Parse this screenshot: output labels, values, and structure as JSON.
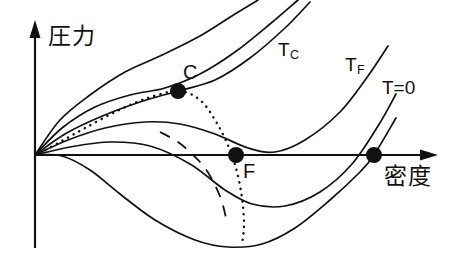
{
  "figure": {
    "name": "pressure-density-isotherm-diagram",
    "axes": {
      "y_axis_label": "圧力",
      "x_axis_label": "密度",
      "origin_label": ""
    },
    "curve_labels": [
      {
        "id": "tc",
        "text": "T",
        "subscript": "C",
        "x": 278,
        "y": 40
      },
      {
        "id": "tf",
        "text": "T",
        "subscript": "F",
        "x": 345,
        "y": 55
      },
      {
        "id": "tzero",
        "text": "T=0",
        "subscript": "",
        "x": 382,
        "y": 78
      }
    ],
    "points": [
      {
        "id": "critical-point",
        "label": "C",
        "x": 178,
        "y": 91,
        "label_x": 183,
        "label_y": 62
      },
      {
        "id": "freezing-point",
        "label": "F",
        "x": 236,
        "y": 155,
        "label_x": 243,
        "label_y": 161
      },
      {
        "id": "zero-temp-point",
        "label": "",
        "x": 374,
        "y": 155,
        "label_x": 0,
        "label_y": 0
      }
    ]
  },
  "chart_data": {
    "type": "line",
    "title": "",
    "xlabel": "密度",
    "ylabel": "圧力",
    "grid": false,
    "legend": "inline-curve-labels",
    "series": [
      {
        "name": "isotherm-1-highest-T",
        "label": "",
        "style": "solid",
        "points": [
          [
            35,
            155
          ],
          [
            60,
            120
          ],
          [
            90,
            95
          ],
          [
            125,
            72
          ],
          [
            160,
            56
          ],
          [
            200,
            36
          ],
          [
            235,
            14
          ],
          [
            258,
            0
          ]
        ]
      },
      {
        "name": "isotherm-2",
        "label": "",
        "style": "solid",
        "points": [
          [
            35,
            155
          ],
          [
            62,
            128
          ],
          [
            95,
            107
          ],
          [
            130,
            95
          ],
          [
            165,
            88
          ],
          [
            200,
            74
          ],
          [
            235,
            52
          ],
          [
            270,
            24
          ],
          [
            298,
            0
          ]
        ]
      },
      {
        "name": "isotherm-3-critical",
        "label": "T_C",
        "style": "solid",
        "points": [
          [
            35,
            155
          ],
          [
            65,
            134
          ],
          [
            100,
            117
          ],
          [
            140,
            102
          ],
          [
            178,
            91
          ],
          [
            215,
            80
          ],
          [
            250,
            58
          ],
          [
            285,
            28
          ],
          [
            310,
            2
          ]
        ]
      },
      {
        "name": "isotherm-4",
        "label": "T_F",
        "style": "solid",
        "points": [
          [
            35,
            155
          ],
          [
            68,
            140
          ],
          [
            105,
            128
          ],
          [
            145,
            122
          ],
          [
            180,
            124
          ],
          [
            215,
            134
          ],
          [
            248,
            148
          ],
          [
            275,
            152
          ],
          [
            305,
            140
          ],
          [
            340,
            112
          ],
          [
            368,
            76
          ],
          [
            388,
            46
          ]
        ]
      },
      {
        "name": "isotherm-5",
        "label": "",
        "style": "solid",
        "points": [
          [
            35,
            155
          ],
          [
            70,
            147
          ],
          [
            110,
            142
          ],
          [
            150,
            146
          ],
          [
            190,
            164
          ],
          [
            225,
            190
          ],
          [
            252,
            204
          ],
          [
            285,
            206
          ],
          [
            320,
            192
          ],
          [
            352,
            164
          ],
          [
            378,
            126
          ],
          [
            396,
            94
          ]
        ]
      },
      {
        "name": "isotherm-6-lowest",
        "label": "T=0",
        "style": "solid",
        "points": [
          [
            35,
            155
          ],
          [
            62,
            156
          ],
          [
            90,
            170
          ],
          [
            120,
            194
          ],
          [
            155,
            220
          ],
          [
            195,
            240
          ],
          [
            228,
            247
          ],
          [
            262,
            244
          ],
          [
            295,
            228
          ],
          [
            330,
            200
          ],
          [
            360,
            172
          ],
          [
            374,
            155
          ],
          [
            396,
            118
          ]
        ]
      },
      {
        "name": "coexistence-curve",
        "label": "",
        "style": "dotted",
        "points": [
          [
            40,
            153
          ],
          [
            60,
            142
          ],
          [
            85,
            128
          ],
          [
            115,
            112
          ],
          [
            145,
            99
          ],
          [
            178,
            91
          ],
          [
            200,
            100
          ],
          [
            215,
            120
          ],
          [
            227,
            143
          ],
          [
            236,
            168
          ],
          [
            242,
            198
          ],
          [
            244,
            225
          ],
          [
            242,
            245
          ]
        ]
      },
      {
        "name": "spinodal-dashed",
        "label": "",
        "style": "dashed",
        "points": [
          [
            160,
            132
          ],
          [
            178,
            142
          ],
          [
            192,
            154
          ],
          [
            205,
            168
          ],
          [
            215,
            185
          ],
          [
            222,
            202
          ],
          [
            226,
            218
          ]
        ]
      }
    ],
    "markers": [
      {
        "label": "C",
        "x": 178,
        "y": 91
      },
      {
        "label": "F",
        "x": 236,
        "y": 155
      },
      {
        "label": "",
        "x": 374,
        "y": 155
      }
    ],
    "axis_geometry": {
      "origin": [
        35,
        155
      ],
      "y_axis_top": 28,
      "y_axis_bottom": 248,
      "x_axis_right": 438
    }
  }
}
